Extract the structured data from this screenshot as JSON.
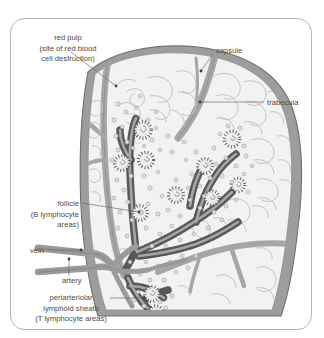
{
  "figure": {
    "frame": {
      "border_color": "#b4b4b4",
      "background_color": "#ffffff"
    },
    "palette": {
      "capsule": "#9d9d9d",
      "capsule_outline": "#7d7d7d",
      "trabecula": "#a6a6a6",
      "parenchyma": "#f2f2f2",
      "red_pulp_outline": "#bdbdbd",
      "white_pulp_stipple": "#585858",
      "lymphocyte": "#d6d6d6",
      "lymphocyte_outline": "#9a9a9a",
      "vessel": "#9a9a9a",
      "label_text": "#4a4a4a",
      "leader_line": "#6e6e6e"
    },
    "labels": [
      {
        "id": "red-pulp",
        "lines": [
          "red pulp",
          "(site of red blood",
          "cell destruction)"
        ],
        "align": "center",
        "x": 68,
        "y": 40,
        "line_height": 10.5,
        "leader": {
          "from_x": 71,
          "from_y": 52,
          "to_x": 116,
          "to_y": 86
        }
      },
      {
        "id": "capsule",
        "lines": [
          "capsule"
        ],
        "align": "start",
        "x": 216,
        "y": 53,
        "line_height": 10.5,
        "leader": {
          "from_x": 213,
          "from_y": 54,
          "to_x": 201,
          "to_y": 71
        }
      },
      {
        "id": "trabecula",
        "lines": [
          "trabecula"
        ],
        "align": "start",
        "x": 267,
        "y": 105,
        "line_height": 10.5,
        "leader": {
          "from_x": 264,
          "from_y": 102,
          "to_x": 200,
          "to_y": 102
        }
      },
      {
        "id": "follicle",
        "lines": [
          "follicle",
          "(B lymphocyte",
          "areas)"
        ],
        "align": "end",
        "x": 79,
        "y": 206,
        "line_height": 10.5,
        "leader": {
          "from_x": 82,
          "from_y": 203,
          "to_x": 139,
          "to_y": 212
        }
      },
      {
        "id": "vein",
        "lines": [
          "vein"
        ],
        "align": "end",
        "x": 44,
        "y": 253,
        "line_height": 10.5,
        "leader": {
          "from_x": 47,
          "from_y": 250,
          "to_x": 81,
          "to_y": 250
        }
      },
      {
        "id": "artery",
        "lines": [
          "artery"
        ],
        "align": "start",
        "x": 62,
        "y": 283,
        "line_height": 10.5,
        "leader": {
          "from_x": 69,
          "from_y": 276,
          "to_x": 69,
          "to_y": 259
        }
      },
      {
        "id": "periarteriolar-lymphoid-sheath",
        "lines": [
          "periarteriolar",
          "lymphoid sheath",
          "(T lymphocyte areas)"
        ],
        "align": "center",
        "x": 71,
        "y": 300,
        "line_height": 10.5,
        "leader": {
          "from_x": 110,
          "from_y": 298,
          "to_x": 144,
          "to_y": 298
        }
      }
    ],
    "structures": [
      {
        "name": "capsule",
        "description": "outer fibrous gray band enclosing the spleen"
      },
      {
        "name": "trabecula",
        "description": "gray connective tissue bands projecting inward from capsule"
      },
      {
        "name": "red-pulp",
        "description": "pale region with worm-like venous sinusoid outlines"
      },
      {
        "name": "white-pulp",
        "description": "dark stippled periarteriolar lymphoid sheath around arterioles"
      },
      {
        "name": "follicle",
        "description": "circular stippled lymphoid nodules with central arteriole"
      },
      {
        "name": "lymphocytes",
        "description": "scattered small circles around the white pulp"
      },
      {
        "name": "splenic-vein",
        "description": "upper vessel at the hilum"
      },
      {
        "name": "splenic-artery",
        "description": "lower vessel at the hilum"
      }
    ]
  }
}
